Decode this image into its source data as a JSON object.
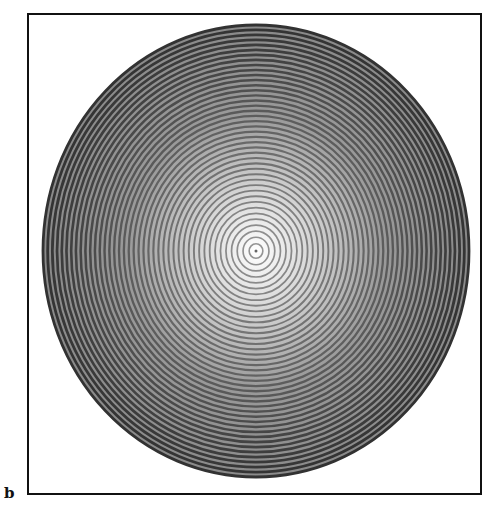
{
  "figure": {
    "panel_label": "b",
    "ellipse": {
      "cx": 256,
      "cy": 251,
      "rx": 213,
      "ry": 226
    },
    "ring_count": 42,
    "colors": {
      "ring_dark": "#3a3a3a",
      "ring_light": "#bdbdbd",
      "center_light": "#ffffff",
      "frame": "#111111",
      "background": "#ffffff"
    }
  }
}
